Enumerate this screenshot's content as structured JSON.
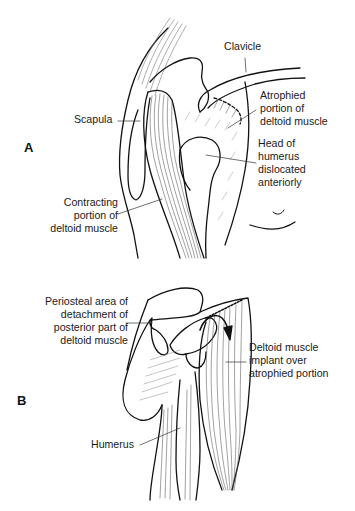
{
  "figure": {
    "panels": [
      {
        "id": "A",
        "letter": "A",
        "labels": {
          "clavicle": "Clavicle",
          "scapula": "Scapula",
          "atrophied_1": "Atrophied",
          "atrophied_2": "portion of",
          "atrophied_3": "deltoid muscle",
          "head_1": "Head of",
          "head_2": "humerus",
          "head_3": "dislocated",
          "head_4": "anteriorly",
          "contracting_1": "Contracting",
          "contracting_2": "portion of",
          "contracting_3": "deltoid muscle"
        }
      },
      {
        "id": "B",
        "letter": "B",
        "labels": {
          "periosteal_1": "Periosteal area of",
          "periosteal_2": "detachment of",
          "periosteal_3": "posterior part of",
          "periosteal_4": "deltoid muscle",
          "implant_1": "Deltoid muscle",
          "implant_2": "implant over",
          "implant_3": "atrophied portion",
          "humerus": "Humerus"
        }
      }
    ],
    "colors": {
      "ink": "#111111",
      "hatch": "#6b6b6b",
      "background": "#ffffff"
    }
  }
}
